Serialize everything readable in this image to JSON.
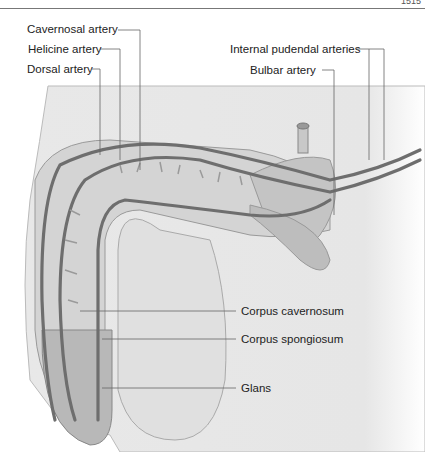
{
  "page": {
    "number": "1515"
  },
  "labels": {
    "cavernosal_artery": "Cavernosal artery",
    "helicine_artery": "Helicine artery",
    "dorsal_artery": "Dorsal artery",
    "internal_pudendal_arteries": "Internal pudendal arteries",
    "bulbar_artery": "Bulbar artery",
    "corpus_cavernosum": "Corpus cavernosum",
    "corpus_spongiosum": "Corpus spongiosum",
    "glans": "Glans"
  },
  "colors": {
    "background_body": "#e4e4e4",
    "artery": "#6e6e6e",
    "tissue": "#bdbdbd",
    "leader_line": "#666666",
    "text": "#222222"
  }
}
